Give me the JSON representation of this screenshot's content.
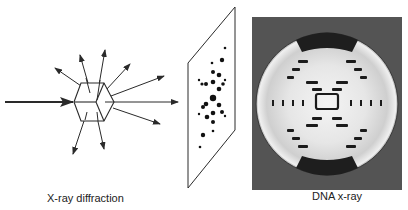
{
  "captions": {
    "left": "X-ray diffraction",
    "right": "DNA x-ray"
  },
  "colors": {
    "line": "#2a2a2a",
    "frame": "#545454",
    "spot": "#111111"
  },
  "diagram": {
    "incident_beam": {
      "x1": 5,
      "y1": 102,
      "x2": 72,
      "y2": 102
    },
    "crystal_center": [
      94,
      102
    ],
    "scattered_rays": 9,
    "detector_plate": "parallelogram with diffraction spot pattern",
    "photo": "DNA fiber X-ray diffraction pattern (circular, X-shaped cross)"
  }
}
